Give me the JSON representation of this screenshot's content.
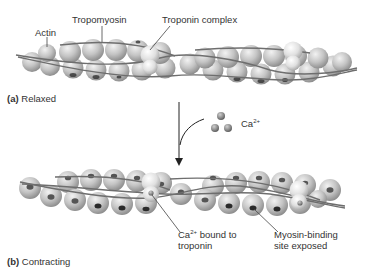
{
  "panel_a": {
    "caption_letter": "(a)",
    "caption_text": "Relaxed",
    "labels": {
      "actin": "Actin",
      "tropomyosin": "Tropomyosin",
      "troponin": "Troponin complex"
    }
  },
  "calcium": {
    "base": "Ca",
    "charge": "2+"
  },
  "panel_b": {
    "caption_letter": "(b)",
    "caption_text": "Contracting",
    "labels": {
      "ca_bound_base": "Ca",
      "ca_bound_charge": "2+",
      "ca_bound_rest_line1": " bound to",
      "ca_bound_line2": "troponin",
      "myosin_line1": "Myosin-binding",
      "myosin_line2": "site exposed"
    }
  },
  "colors": {
    "bead_fill": "#bdbdbd",
    "bead_highlight": "#eeeeee",
    "bead_shadow": "#8a8a8a",
    "strand": "#777777",
    "binding_site": "#2a2a2a",
    "troponin": "#e2e2e2",
    "text": "#333333"
  }
}
